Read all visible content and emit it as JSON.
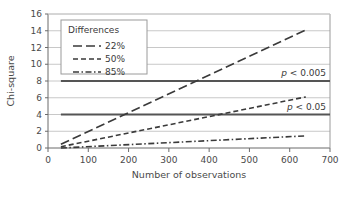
{
  "chart_data": {
    "type": "line",
    "title": "",
    "xlabel": "Number of observations",
    "ylabel": "Chi-square",
    "xlim": [
      0,
      700
    ],
    "ylim": [
      0,
      16
    ],
    "xticks": [
      0,
      100,
      200,
      300,
      400,
      500,
      600,
      700
    ],
    "yticks": [
      0,
      2,
      4,
      6,
      8,
      10,
      12,
      14,
      16
    ],
    "xtick_labels": [
      "0",
      "100",
      "200",
      "300",
      "400",
      "500",
      "600",
      "700"
    ],
    "ytick_labels": [
      "0",
      "2",
      "4",
      "6",
      "8",
      "10",
      "12",
      "14",
      "16"
    ],
    "grid": "horizontal",
    "legend_position": "top-left-inside",
    "legend_title": "Differences",
    "series": [
      {
        "name": "22%",
        "style": "long-dash",
        "color": "#3a3a3a",
        "x": [
          32,
          640
        ],
        "values": [
          0.45,
          14.1
        ]
      },
      {
        "name": "50%",
        "style": "short-dash",
        "color": "#3a3a3a",
        "x": [
          32,
          640
        ],
        "values": [
          0.15,
          6.1
        ]
      },
      {
        "name": "85%",
        "style": "dash-dot",
        "color": "#3a3a3a",
        "x": [
          32,
          640
        ],
        "values": [
          0.0,
          1.45
        ]
      }
    ],
    "threshold_lines": [
      {
        "name": "p < 0.005",
        "label_plain": "p < 0.005",
        "label_italic_part": "p",
        "label_rest": " < 0.005",
        "y": 8,
        "x_start": 32,
        "x_end": 700,
        "style": "solid",
        "color": "#555555"
      },
      {
        "name": "p < 0.05",
        "label_plain": "p < 0.05",
        "label_italic_part": "p",
        "label_rest": " < 0.05",
        "y": 4,
        "x_start": 32,
        "x_end": 700,
        "style": "solid",
        "color": "#555555"
      }
    ],
    "colors": {
      "background": "#ffffff",
      "gridline": "#c8c8c8",
      "axis": "#6b6b6b",
      "series": "#3a3a3a",
      "threshold": "#555555",
      "text": "#4a4a4a",
      "legend_border": "#9a9a9a"
    }
  },
  "legend": {
    "title": "Differences",
    "items": [
      {
        "label": "22%",
        "style": "long-dash"
      },
      {
        "label": "50%",
        "style": "short-dash"
      },
      {
        "label": "85%",
        "style": "dash-dot"
      }
    ]
  },
  "axes": {
    "x_title": "Number of observations",
    "y_title": "Chi-square"
  }
}
